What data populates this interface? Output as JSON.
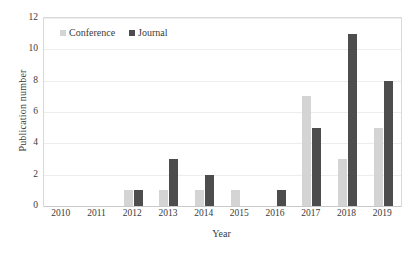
{
  "chart_data": {
    "type": "bar",
    "title": "",
    "xlabel": "Year",
    "ylabel": "Publication number",
    "categories": [
      "2010",
      "2011",
      "2012",
      "2013",
      "2014",
      "2015",
      "2016",
      "2017",
      "2018",
      "2019"
    ],
    "series": [
      {
        "name": "Conference",
        "color": "#d4d4d4",
        "values": [
          0,
          0,
          1,
          1,
          1,
          1,
          0,
          7,
          3,
          5
        ]
      },
      {
        "name": "Journal",
        "color": "#4d4d4d",
        "values": [
          0,
          0,
          1,
          3,
          2,
          0,
          1,
          5,
          11,
          8
        ]
      }
    ],
    "ylim": [
      0,
      12
    ],
    "yticks": [
      0,
      2,
      4,
      6,
      8,
      10,
      12
    ],
    "grid": true,
    "legend_position": "top-left-inside"
  },
  "colors": {
    "conference": "#d4d4d4",
    "journal": "#4d4d4d",
    "gridline": "#ededed",
    "frame": "#d9d9d9",
    "text": "#3a3a3a"
  }
}
